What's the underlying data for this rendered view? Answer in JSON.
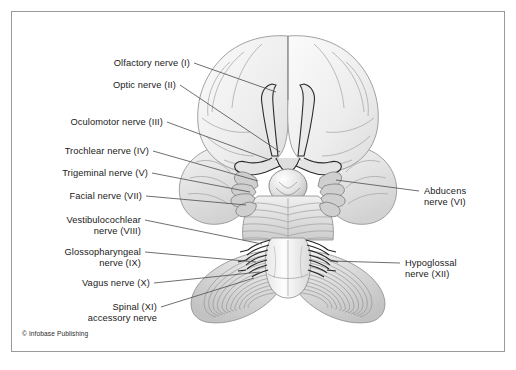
{
  "figure": {
    "credit": "© Infobase Publishing",
    "border_color": "#9a9a9a",
    "background_color": "#ffffff",
    "line_color": "#555555",
    "illustration": {
      "name": "inferior-view-of-brain",
      "parts": [
        "frontal lobes",
        "olfactory tracts",
        "optic chiasm",
        "temporal lobes",
        "pituitary / infundibulum",
        "pons",
        "trigeminal nerve fans",
        "medulla oblongata",
        "cerebellar hemispheres",
        "nerve rootlets"
      ]
    }
  },
  "labels_left": [
    {
      "id": "olfactory",
      "lines": [
        "Olfactory nerve (I)"
      ]
    },
    {
      "id": "optic",
      "lines": [
        "Optic nerve (II)"
      ]
    },
    {
      "id": "oculomotor",
      "lines": [
        "Oculomotor nerve (III)"
      ]
    },
    {
      "id": "trochlear",
      "lines": [
        "Trochlear nerve (IV)"
      ]
    },
    {
      "id": "trigeminal",
      "lines": [
        "Trigeminal nerve (V)"
      ]
    },
    {
      "id": "facial",
      "lines": [
        "Facial nerve (VII)"
      ]
    },
    {
      "id": "vestibulocochlear",
      "lines": [
        "Vestibulocochlear",
        "nerve (VIII)"
      ]
    },
    {
      "id": "glossopharyngeal",
      "lines": [
        "Glossopharyngeal",
        "nerve (IX)"
      ]
    },
    {
      "id": "vagus",
      "lines": [
        "Vagus nerve (X)"
      ]
    },
    {
      "id": "spinal_accessory",
      "lines": [
        "Spinal (XI)",
        "accessory nerve"
      ]
    }
  ],
  "labels_right": [
    {
      "id": "abducens",
      "lines": [
        "Abducens",
        "nerve (VI)"
      ]
    },
    {
      "id": "hypoglossal",
      "lines": [
        "Hypoglossal",
        "nerve (XII)"
      ]
    }
  ]
}
